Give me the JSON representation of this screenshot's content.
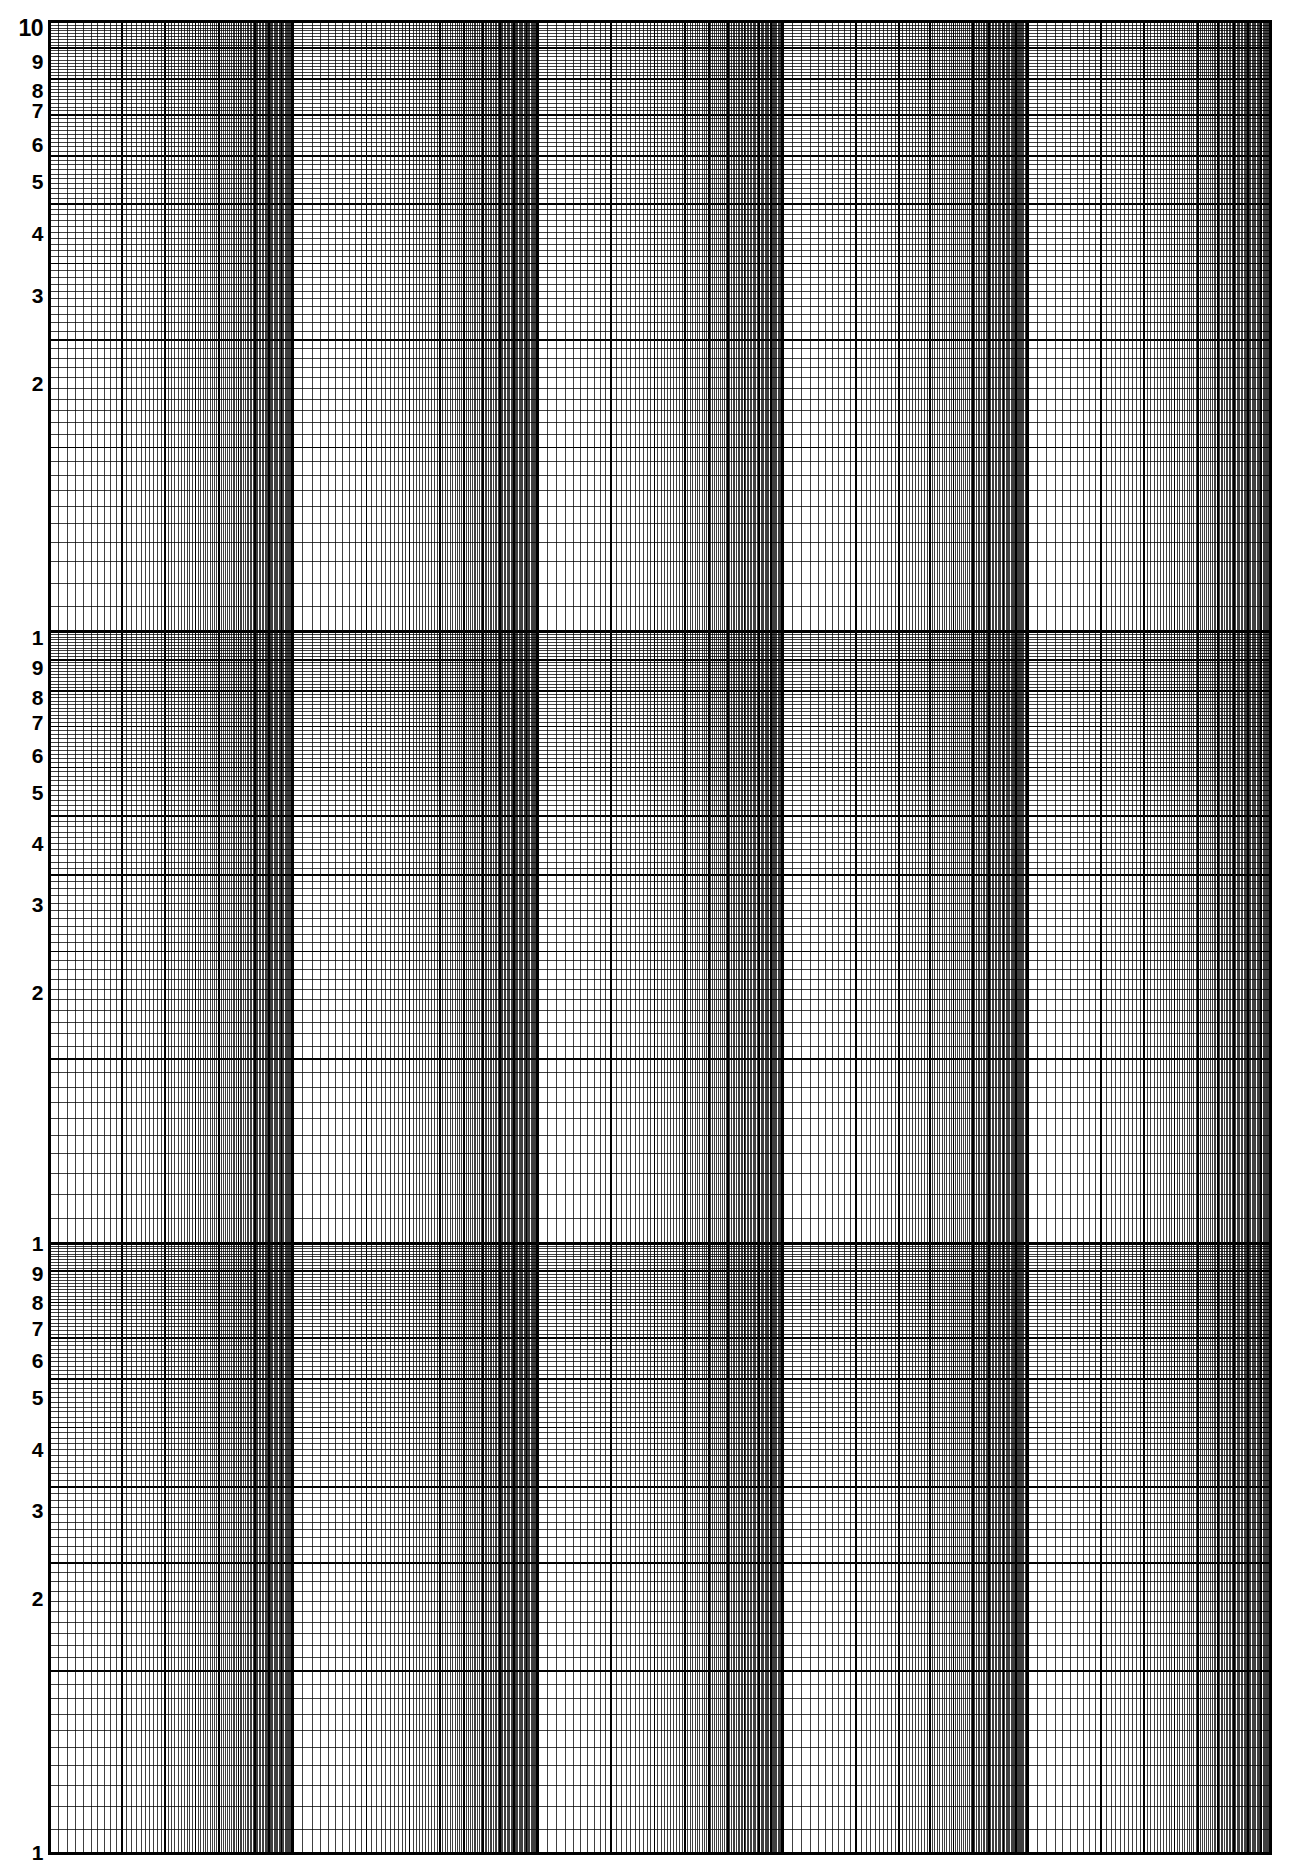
{
  "document": {
    "title": "Logarithmic Graph Paper",
    "kind": "log-log-grid-sheet",
    "background_color": "#ffffff",
    "line_color": "#000000",
    "width_px": 1305,
    "height_px": 1869
  },
  "plot_area": {
    "left_px": 48,
    "top_px": 20,
    "right_px": 1272,
    "bottom_px": 1855,
    "border_color": "#000000"
  },
  "axis_labels": {
    "y": [
      {
        "text": "10",
        "value": 1000,
        "y_px": 28
      },
      {
        "text": "9",
        "value": 900,
        "y_px": 61
      },
      {
        "text": "8",
        "value": 800,
        "y_px": 90
      },
      {
        "text": "7",
        "value": 700,
        "y_px": 110
      },
      {
        "text": "6",
        "value": 600,
        "y_px": 144
      },
      {
        "text": "5",
        "value": 500,
        "y_px": 181
      },
      {
        "text": "4",
        "value": 400,
        "y_px": 233
      },
      {
        "text": "3",
        "value": 300,
        "y_px": 295
      },
      {
        "text": "2",
        "value": 200,
        "y_px": 383
      },
      {
        "text": "1",
        "value": 100,
        "y_px": 637
      },
      {
        "text": "9",
        "value": 90,
        "y_px": 667
      },
      {
        "text": "8",
        "value": 80,
        "y_px": 697
      },
      {
        "text": "7",
        "value": 70,
        "y_px": 722
      },
      {
        "text": "6",
        "value": 60,
        "y_px": 755
      },
      {
        "text": "5",
        "value": 50,
        "y_px": 792
      },
      {
        "text": "4",
        "value": 40,
        "y_px": 843
      },
      {
        "text": "3",
        "value": 30,
        "y_px": 904
      },
      {
        "text": "2",
        "value": 20,
        "y_px": 992
      },
      {
        "text": "1",
        "value": 10,
        "y_px": 1243
      },
      {
        "text": "9",
        "value": 9,
        "y_px": 1273
      },
      {
        "text": "8",
        "value": 8,
        "y_px": 1302
      },
      {
        "text": "7",
        "value": 7,
        "y_px": 1328
      },
      {
        "text": "6",
        "value": 6,
        "y_px": 1360
      },
      {
        "text": "5",
        "value": 5,
        "y_px": 1397
      },
      {
        "text": "4",
        "value": 4,
        "y_px": 1449
      },
      {
        "text": "3",
        "value": 3,
        "y_px": 1510
      },
      {
        "text": "2",
        "value": 2,
        "y_px": 1598
      },
      {
        "text": "1",
        "value": 1,
        "y_px": 1852
      }
    ],
    "x": []
  },
  "chart_data": {
    "type": "grid",
    "title": "",
    "subtitle": "",
    "xlabel": "",
    "ylabel": "",
    "grid": true,
    "legend": "none",
    "annotations": [],
    "series": [],
    "x_axis": {
      "scale": "log",
      "decades": 5,
      "min": 1,
      "max": 100000,
      "tick_mantissas": [
        1,
        2,
        3,
        4,
        5,
        6,
        7,
        8,
        9
      ],
      "minor_subdivisions": 10,
      "tick_labels": []
    },
    "y_axis": {
      "scale": "log",
      "decades": 3,
      "min": 1,
      "max": 1000,
      "tick_mantissas": [
        1,
        2,
        3,
        4,
        5,
        6,
        7,
        8,
        9,
        10
      ],
      "minor_subdivisions": 10,
      "tick_labels": [
        "1",
        "2",
        "3",
        "4",
        "5",
        "6",
        "7",
        "8",
        "9",
        "10"
      ]
    },
    "line_weights": {
      "decade_px": 3.0,
      "major_px": 1.7,
      "minor_px": 0.75
    }
  }
}
